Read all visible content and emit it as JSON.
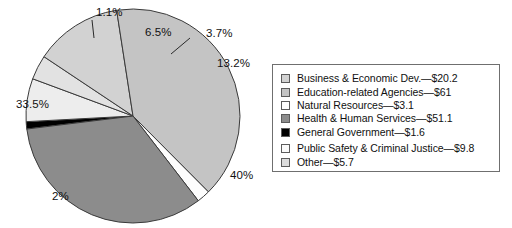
{
  "chart_data": {
    "type": "pie",
    "title": "",
    "subtitle": "",
    "xlabel": "",
    "ylabel": "",
    "grid": false,
    "legend_position": "right",
    "unit": "billions of dollars",
    "total": 152.5,
    "categories": [
      "Business & Economic Dev.",
      "Education-related Agencies",
      "Natural Resources",
      "Health & Human Services",
      "General Government",
      "Public Safety & Criminal Justice",
      "Other"
    ],
    "values": [
      20.2,
      61,
      3.1,
      51.1,
      1.6,
      9.8,
      5.7
    ],
    "percentages": [
      13.2,
      40,
      2,
      33.5,
      1.1,
      6.5,
      3.7
    ],
    "slice_colors": [
      "#d2d2d2",
      "#c4c4c4",
      "#fdfdfd",
      "#8c8c8c",
      "#000000",
      "#ededed",
      "#e2e2e2"
    ],
    "slices": [
      {
        "label": "Business & Economic Dev.",
        "amount": 20.2,
        "percent": 13.2,
        "color": "#d2d2d2"
      },
      {
        "label": "Education-related Agencies",
        "amount": 61,
        "percent": 40,
        "color": "#c4c4c4"
      },
      {
        "label": "Natural Resources",
        "amount": 3.1,
        "percent": 2,
        "color": "#fdfdfd"
      },
      {
        "label": "Health & Human Services",
        "amount": 51.1,
        "percent": 33.5,
        "color": "#8c8c8c"
      },
      {
        "label": "General Government",
        "amount": 1.6,
        "percent": 1.1,
        "color": "#000000"
      },
      {
        "label": "Public Safety & Criminal Justice",
        "amount": 9.8,
        "percent": 6.5,
        "color": "#ededed"
      },
      {
        "label": "Other",
        "amount": 5.7,
        "percent": 3.7,
        "color": "#e2e2e2"
      }
    ]
  },
  "pie": {
    "labels": [
      {
        "text": "1.1%",
        "x": 82,
        "y": 2,
        "slice": "General Government"
      },
      {
        "text": "6.5%",
        "x": 131,
        "y": 22,
        "slice": "Public Safety & Criminal Justice"
      },
      {
        "text": "3.7%",
        "x": 192,
        "y": 23,
        "slice": "Other"
      },
      {
        "text": "13.2%",
        "x": 203,
        "y": 53,
        "slice": "Business & Economic Dev."
      },
      {
        "text": "40%",
        "x": 216,
        "y": 165,
        "slice": "Education-related Agencies"
      },
      {
        "text": "2%",
        "x": 38,
        "y": 186,
        "slice": "Natural Resources"
      },
      {
        "text": "33.5%",
        "x": 2,
        "y": 94,
        "slice": "Health & Human Services"
      }
    ]
  },
  "legend": {
    "items": [
      {
        "swatch": "#d2d2d2",
        "text": "Business & Economic Dev.—$20.2"
      },
      {
        "swatch": "#c4c4c4",
        "text": "Education-related Agencies—$61"
      },
      {
        "swatch": "#ffffff",
        "text": "Natural Resources—$3.1"
      },
      {
        "swatch": "#8c8c8c",
        "text": "Health & Human Services—$51.1"
      },
      {
        "swatch": "#000000",
        "text": "General Government—$1.6"
      },
      {
        "swatch": "#fafafa",
        "text": "Public Safety & Criminal Justice—$9.8"
      },
      {
        "swatch": "#dcdcdc",
        "text": "Other—$5.7"
      }
    ]
  },
  "colors": {
    "background": "#ffffff",
    "outline": "#3a3a3a",
    "legend_border": "#6f6f6f",
    "text": "#101010"
  }
}
